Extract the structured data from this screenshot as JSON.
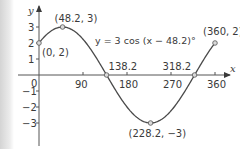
{
  "chart_data": {
    "type": "line",
    "title": "",
    "xlabel": "x",
    "ylabel": "y",
    "equation": "y = 3 cos (x − 48.2)°",
    "xlim": [
      0,
      360
    ],
    "ylim": [
      -3,
      3
    ],
    "x_ticks": [
      "90",
      "180",
      "270",
      "360"
    ],
    "y_ticks": [
      "3",
      "2",
      "1",
      "−1",
      "−2",
      "−3"
    ],
    "origin_label": "0",
    "grid": false,
    "series": [
      {
        "name": "y = 3 cos (x − 48.2)°",
        "amplitude": 3,
        "phase_shift": 48.2,
        "x_range": [
          0,
          360
        ]
      }
    ],
    "annotations": [
      {
        "x": 0,
        "y": 2,
        "label": "(0, 2)"
      },
      {
        "x": 48.2,
        "y": 3,
        "label": "(48.2, 3)"
      },
      {
        "x": 138.2,
        "y": 0,
        "label": "138.2"
      },
      {
        "x": 228.2,
        "y": -3,
        "label": "(228.2, −3)"
      },
      {
        "x": 318.2,
        "y": 0,
        "label": "318.2"
      },
      {
        "x": 360,
        "y": 2,
        "label": "(360, 2)"
      }
    ]
  }
}
